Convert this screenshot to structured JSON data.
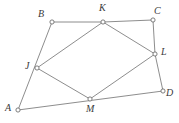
{
  "figure": {
    "canvas": {
      "width": 179,
      "height": 123,
      "background": "#ffffff"
    },
    "style": {
      "edge_color": "#808080",
      "edge_width": 0.9,
      "marker_fill": "#ffffff",
      "marker_stroke": "#707070",
      "marker_radius": 2.1,
      "label_color": "#3a3a3a",
      "label_font_size": 10
    },
    "vertices": [
      {
        "id": "A",
        "label": "A",
        "x": 18,
        "y": 110,
        "label_x": 5,
        "label_y": 103
      },
      {
        "id": "B",
        "label": "B",
        "x": 52,
        "y": 22,
        "label_x": 38,
        "label_y": 9
      },
      {
        "id": "C",
        "label": "C",
        "x": 153,
        "y": 20,
        "label_x": 154,
        "label_y": 6
      },
      {
        "id": "D",
        "label": "D",
        "x": 163,
        "y": 91,
        "label_x": 166,
        "label_y": 88
      },
      {
        "id": "J",
        "label": "J",
        "x": 37,
        "y": 68,
        "label_x": 25,
        "label_y": 61
      },
      {
        "id": "K",
        "label": "K",
        "x": 103,
        "y": 22,
        "label_x": 99,
        "label_y": 3
      },
      {
        "id": "L",
        "label": "L",
        "x": 155,
        "y": 54,
        "label_x": 161,
        "label_y": 47
      },
      {
        "id": "M",
        "label": "M",
        "x": 90,
        "y": 99,
        "label_x": 86,
        "label_y": 104
      }
    ],
    "edges": [
      {
        "from": "A",
        "to": "B",
        "name": "edge-a-b"
      },
      {
        "from": "B",
        "to": "K",
        "name": "edge-b-k"
      },
      {
        "from": "K",
        "to": "C",
        "name": "edge-k-c"
      },
      {
        "from": "C",
        "to": "L",
        "name": "edge-c-l"
      },
      {
        "from": "L",
        "to": "D",
        "name": "edge-l-d"
      },
      {
        "from": "A",
        "to": "D",
        "name": "edge-a-d"
      },
      {
        "from": "J",
        "to": "K",
        "name": "edge-j-k"
      },
      {
        "from": "K",
        "to": "L",
        "name": "edge-k-l"
      },
      {
        "from": "L",
        "to": "M",
        "name": "edge-l-m"
      },
      {
        "from": "M",
        "to": "J",
        "name": "edge-m-j"
      }
    ]
  }
}
